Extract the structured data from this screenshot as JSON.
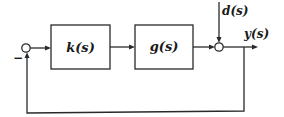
{
  "diagram": {
    "type": "feedback-control-block-diagram",
    "blocks": [
      {
        "id": "controller",
        "label": "k(s)"
      },
      {
        "id": "plant",
        "label": "g(s)"
      }
    ],
    "summing_junctions": [
      {
        "id": "error-sum",
        "sign_label": "−"
      },
      {
        "id": "disturbance-sum"
      }
    ],
    "signals": {
      "disturbance": "d(s)",
      "output": "y(s)"
    },
    "colors": {
      "line": "#2a2a2a",
      "background": "#ffffff"
    }
  }
}
